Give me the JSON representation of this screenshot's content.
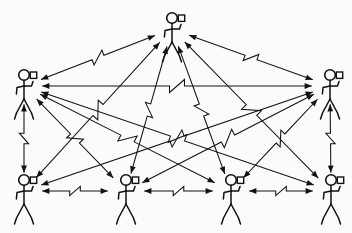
{
  "figure": {
    "background_color": "#fbfbfb",
    "line_color": "#121212"
  },
  "diagram": {
    "type": "network-topology",
    "node_icon_name": "stick-figure-with-handheld-radio",
    "link_icon_name": "zigzag-wireless-link-arrow",
    "node_count": 7,
    "link_count": 18,
    "nodes": [
      {
        "id": "n0",
        "label": "",
        "role": "top-node",
        "x": 172,
        "y": 18,
        "scale": 1.0
      },
      {
        "id": "n1",
        "label": "",
        "role": "middle-left-node",
        "x": 24,
        "y": 75,
        "scale": 1.0
      },
      {
        "id": "n2",
        "label": "",
        "role": "middle-right-node",
        "x": 330,
        "y": 75,
        "scale": 1.0
      },
      {
        "id": "n3",
        "label": "",
        "role": "bottom-node-1",
        "x": 24,
        "y": 180,
        "scale": 1.0
      },
      {
        "id": "n4",
        "label": "",
        "role": "bottom-node-2",
        "x": 126,
        "y": 180,
        "scale": 1.0
      },
      {
        "id": "n5",
        "label": "",
        "role": "bottom-node-3",
        "x": 231,
        "y": 180,
        "scale": 1.0
      },
      {
        "id": "n6",
        "label": "",
        "role": "bottom-node-4",
        "x": 331,
        "y": 180,
        "scale": 1.0
      }
    ],
    "links": [
      {
        "id": "l0",
        "from": "n1",
        "to": "n0",
        "arrows": "both",
        "style": "zigzag"
      },
      {
        "id": "l1",
        "from": "n2",
        "to": "n0",
        "arrows": "both",
        "style": "zigzag"
      },
      {
        "id": "l2",
        "from": "n1",
        "to": "n2",
        "arrows": "both",
        "style": "zigzag"
      },
      {
        "id": "l3",
        "from": "n3",
        "to": "n0",
        "arrows": "both",
        "style": "zigzag"
      },
      {
        "id": "l4",
        "from": "n4",
        "to": "n0",
        "arrows": "both",
        "style": "zigzag"
      },
      {
        "id": "l5",
        "from": "n5",
        "to": "n0",
        "arrows": "both",
        "style": "zigzag"
      },
      {
        "id": "l6",
        "from": "n6",
        "to": "n0",
        "arrows": "both",
        "style": "zigzag"
      },
      {
        "id": "l7",
        "from": "n1",
        "to": "n3",
        "arrows": "both",
        "style": "zigzag"
      },
      {
        "id": "l8",
        "from": "n2",
        "to": "n6",
        "arrows": "both",
        "style": "zigzag"
      },
      {
        "id": "l9",
        "from": "n1",
        "to": "n4",
        "arrows": "both",
        "style": "zigzag"
      },
      {
        "id": "l10",
        "from": "n2",
        "to": "n5",
        "arrows": "both",
        "style": "zigzag"
      },
      {
        "id": "l11",
        "from": "n3",
        "to": "n4",
        "arrows": "both",
        "style": "zigzag"
      },
      {
        "id": "l12",
        "from": "n4",
        "to": "n5",
        "arrows": "both",
        "style": "zigzag"
      },
      {
        "id": "l13",
        "from": "n5",
        "to": "n6",
        "arrows": "both",
        "style": "zigzag"
      },
      {
        "id": "l14",
        "from": "n3",
        "to": "n2",
        "arrows": "both",
        "style": "zigzag"
      },
      {
        "id": "l15",
        "from": "n4",
        "to": "n2",
        "arrows": "both",
        "style": "zigzag"
      },
      {
        "id": "l16",
        "from": "n6",
        "to": "n1",
        "arrows": "both",
        "style": "zigzag"
      },
      {
        "id": "l17",
        "from": "n5",
        "to": "n1",
        "arrows": "both",
        "style": "zigzag"
      }
    ]
  }
}
